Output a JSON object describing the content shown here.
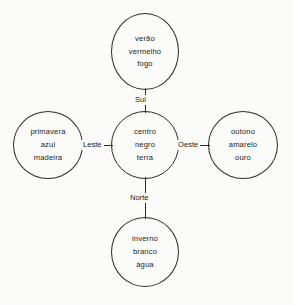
{
  "diagram": {
    "background_color": "#fbfbf9",
    "stroke_color": "#2f2b28",
    "text_color": "#201d1b"
  },
  "chart_data": {
    "type": "diagram",
    "layout": "cross-quincunx",
    "title": "",
    "nodes": [
      {
        "id": "centro",
        "position": "center",
        "lines": [
          "centro",
          "negro",
          "terra"
        ]
      },
      {
        "id": "verao",
        "position": "top",
        "lines": [
          "verão",
          "vermelho",
          "fogo"
        ]
      },
      {
        "id": "inverno",
        "position": "bottom",
        "lines": [
          "inverno",
          "branco",
          "água"
        ]
      },
      {
        "id": "primavera",
        "position": "left",
        "lines": [
          "primavera",
          "azul",
          "madeira"
        ]
      },
      {
        "id": "outono",
        "position": "right",
        "lines": [
          "outono",
          "amarelo",
          "ouro"
        ]
      }
    ],
    "edges": [
      {
        "from": "centro",
        "to": "verao",
        "label": "Sul",
        "direction": "up"
      },
      {
        "from": "centro",
        "to": "inverno",
        "label": "Norte",
        "direction": "down"
      },
      {
        "from": "centro",
        "to": "primavera",
        "label": "Leste",
        "direction": "left"
      },
      {
        "from": "centro",
        "to": "outono",
        "label": "Oeste",
        "direction": "right"
      }
    ]
  },
  "nodes": {
    "center": {
      "line1": "centro",
      "line2": "negro",
      "line3": "terra"
    },
    "top": {
      "line1": "verão",
      "line2": "vermelho",
      "line3": "fogo"
    },
    "bottom": {
      "line1": "inverno",
      "line2": "branco",
      "line3": "água"
    },
    "left": {
      "line1": "primavera",
      "line2": "azul",
      "line3": "madeira"
    },
    "right": {
      "line1": "outono",
      "line2": "amarelo",
      "line3": "ouro"
    }
  },
  "edge_labels": {
    "top": "Sul",
    "bottom": "Norte",
    "left": "Leste",
    "right": "Oeste"
  }
}
